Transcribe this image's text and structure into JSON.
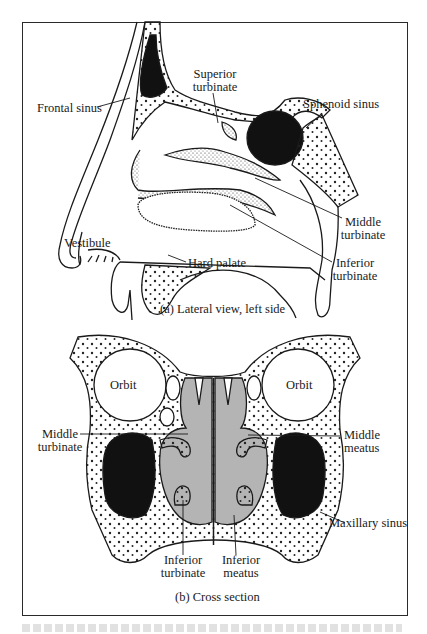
{
  "figure": {
    "panel_a": {
      "caption": "(a) Lateral view, left side",
      "labels": {
        "frontal_sinus": "Frontal sinus",
        "superior_turbinate_1": "Superior",
        "superior_turbinate_2": "turbinate",
        "sphenoid_sinus": "Sphenoid sinus",
        "middle_turbinate_1": "Middle",
        "middle_turbinate_2": "turbinate",
        "vestibule": "Vestibule",
        "hard_palate": "Hard palate",
        "inferior_turbinate_1": "Inferior",
        "inferior_turbinate_2": "turbinate"
      }
    },
    "panel_b": {
      "caption": "(b) Cross section",
      "labels": {
        "orbit_left": "Orbit",
        "orbit_right": "Orbit",
        "middle_turbinate_1": "Middle",
        "middle_turbinate_2": "turbinate",
        "middle_meatus_1": "Middle",
        "middle_meatus_2": "meatus",
        "maxillary_sinus": "Maxillary sinus",
        "inferior_turbinate_1": "Inferior",
        "inferior_turbinate_2": "turbinate",
        "inferior_meatus_1": "Inferior",
        "inferior_meatus_2": "meatus"
      }
    },
    "colors": {
      "line": "#1a1a1a",
      "cavity_fill": "#111111",
      "airway_fill": "#b4b4b4",
      "background": "#ffffff"
    }
  }
}
